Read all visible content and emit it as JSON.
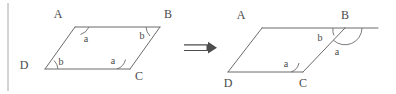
{
  "figure": {
    "type": "geometry-diagram",
    "background_color": "#ffffff",
    "stroke_color": "#6b6b6b",
    "text_color": "#4a4a4a",
    "frame_color": "#a8a8a8",
    "transform_symbol": "double-right-arrow",
    "left_figure": {
      "name": "parallelogram-abcd-original",
      "vertices": [
        {
          "id": "A",
          "label": "A",
          "x": 75,
          "y": 27,
          "label_x": 58,
          "label_y": 18
        },
        {
          "id": "B",
          "label": "B",
          "x": 160,
          "y": 27,
          "label_x": 168,
          "label_y": 18
        },
        {
          "id": "C",
          "label": "C",
          "x": 130,
          "y": 69,
          "label_x": 139,
          "label_y": 80
        },
        {
          "id": "D",
          "label": "D",
          "x": 45,
          "y": 69,
          "label_x": 24,
          "label_y": 69
        }
      ],
      "angles": [
        {
          "at": "A",
          "label": "a",
          "label_x": 86,
          "label_y": 42
        },
        {
          "at": "B",
          "label": "b",
          "label_x": 142,
          "label_y": 39
        },
        {
          "at": "C",
          "label": "a",
          "label_x": 113,
          "label_y": 64
        },
        {
          "at": "D",
          "label": "b",
          "label_x": 61,
          "label_y": 65
        }
      ]
    },
    "right_figure": {
      "name": "parallelogram-abcd-extended",
      "vertices": [
        {
          "id": "A",
          "label": "A",
          "x": 262,
          "y": 28,
          "label_x": 241,
          "label_y": 19
        },
        {
          "id": "B",
          "label": "B",
          "x": 345,
          "y": 28,
          "label_x": 340,
          "label_y": 19
        },
        {
          "id": "C",
          "label": "C",
          "x": 303,
          "y": 72,
          "label_x": 302,
          "label_y": 87
        },
        {
          "id": "D",
          "label": "D",
          "x": 228,
          "y": 72,
          "label_x": 227,
          "label_y": 87
        }
      ],
      "extension": {
        "from": "B",
        "to_x": 378,
        "to_y": 28
      },
      "angles": [
        {
          "at": "B",
          "label": "b",
          "label_x": 320,
          "label_y": 41
        },
        {
          "at": "B",
          "label": "a",
          "label_x": 337,
          "label_y": 55
        },
        {
          "at": "C",
          "label": "a",
          "label_x": 286,
          "label_y": 67
        }
      ]
    },
    "frame": {
      "left_border_x": 8,
      "top_y": 3,
      "bottom_y": 91
    }
  }
}
